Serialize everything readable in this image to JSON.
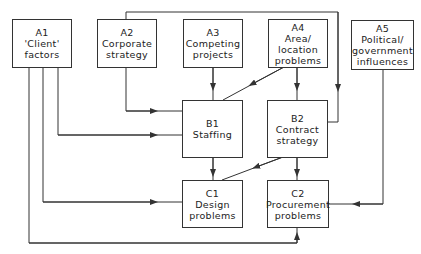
{
  "diagram": {
    "nodes": [
      {
        "id": "A1",
        "lines": [
          "A1",
          "'Client'",
          "factors"
        ]
      },
      {
        "id": "A2",
        "lines": [
          "A2",
          "Corporate",
          "strategy"
        ]
      },
      {
        "id": "A3",
        "lines": [
          "A3",
          "Competing",
          "projects"
        ]
      },
      {
        "id": "A4",
        "lines": [
          "A4",
          "Area/",
          "location",
          "problems"
        ]
      },
      {
        "id": "A5",
        "lines": [
          "A5",
          "Political/",
          "government",
          "influences"
        ]
      },
      {
        "id": "B1",
        "lines": [
          "B1",
          "Staffing"
        ]
      },
      {
        "id": "B2",
        "lines": [
          "B2",
          "Contract",
          "strategy"
        ]
      },
      {
        "id": "C1",
        "lines": [
          "C1",
          "Design",
          "problems"
        ]
      },
      {
        "id": "C2",
        "lines": [
          "C2",
          "Procurement",
          "problems"
        ]
      }
    ],
    "edges": [
      {
        "from": "A1",
        "to": "B1"
      },
      {
        "from": "A1",
        "to": "C1"
      },
      {
        "from": "A1",
        "to": "C2"
      },
      {
        "from": "A2",
        "to": "B1"
      },
      {
        "from": "A2",
        "to": "B2"
      },
      {
        "from": "A3",
        "to": "B1"
      },
      {
        "from": "A4",
        "to": "B1"
      },
      {
        "from": "A4",
        "to": "B2"
      },
      {
        "from": "A5",
        "to": "C2"
      },
      {
        "from": "B1",
        "to": "C1"
      },
      {
        "from": "B2",
        "to": "C1"
      },
      {
        "from": "B2",
        "to": "C2"
      }
    ],
    "line_color": "#333333"
  }
}
